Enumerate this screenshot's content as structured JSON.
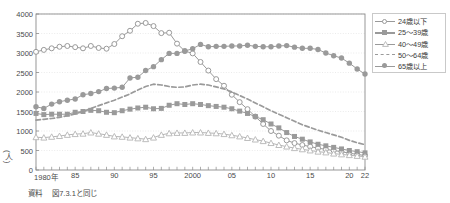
{
  "chart_data": {
    "type": "line",
    "title": "",
    "xlabel": "",
    "ylabel": "(人)",
    "ylim": [
      0,
      4000
    ],
    "ytick_step": 500,
    "yticks": [
      0,
      500,
      1000,
      1500,
      2000,
      2500,
      3000,
      3500,
      4000
    ],
    "grid": true,
    "legend_position": "right",
    "x": [
      1980,
      1981,
      1982,
      1983,
      1984,
      1985,
      1986,
      1987,
      1988,
      1989,
      1990,
      1991,
      1992,
      1993,
      1994,
      1995,
      1996,
      1997,
      1998,
      1999,
      2000,
      2001,
      2002,
      2003,
      2004,
      2005,
      2006,
      2007,
      2008,
      2009,
      2010,
      2011,
      2012,
      2013,
      2014,
      2015,
      2016,
      2017,
      2018,
      2019,
      2020,
      2021,
      2022
    ],
    "xtick_labels": [
      "1980年",
      "85",
      "90",
      "95",
      "2000",
      "05",
      "10",
      "15",
      "20",
      "22"
    ],
    "xtick_values": [
      1980,
      1985,
      1990,
      1995,
      2000,
      2005,
      2010,
      2015,
      2020,
      2022
    ],
    "series": [
      {
        "name": "24歳以下",
        "marker": "open-circle",
        "line": "solid",
        "color": "#9a9a9a",
        "values": [
          3030,
          3080,
          3120,
          3160,
          3180,
          3150,
          3120,
          3180,
          3130,
          3110,
          3230,
          3430,
          3570,
          3750,
          3770,
          3690,
          3510,
          3520,
          3240,
          3050,
          2990,
          2770,
          2550,
          2330,
          2160,
          1930,
          1740,
          1560,
          1370,
          1180,
          1000,
          880,
          760,
          690,
          640,
          600,
          560,
          530,
          500,
          470,
          430,
          400,
          370
        ]
      },
      {
        "name": "25～39歳",
        "marker": "filled-square",
        "line": "solid",
        "color": "#9a9a9a",
        "values": [
          1450,
          1420,
          1430,
          1430,
          1430,
          1480,
          1500,
          1530,
          1520,
          1480,
          1470,
          1520,
          1560,
          1590,
          1610,
          1570,
          1580,
          1660,
          1700,
          1680,
          1700,
          1680,
          1650,
          1630,
          1610,
          1570,
          1510,
          1450,
          1370,
          1290,
          1180,
          1080,
          960,
          860,
          790,
          720,
          660,
          620,
          580,
          540,
          500,
          470,
          440
        ]
      },
      {
        "name": "40～49歳",
        "marker": "open-triangle",
        "line": "solid",
        "color": "#b5b5b5",
        "values": [
          840,
          830,
          850,
          870,
          900,
          920,
          930,
          960,
          930,
          900,
          860,
          850,
          830,
          810,
          790,
          830,
          900,
          940,
          950,
          950,
          960,
          960,
          950,
          940,
          920,
          890,
          860,
          820,
          780,
          740,
          690,
          640,
          600,
          560,
          530,
          500,
          470,
          450,
          420,
          400,
          380,
          360,
          340
        ]
      },
      {
        "name": "50～64歳",
        "marker": "none",
        "line": "dashed",
        "color": "#9a9a9a",
        "values": [
          1280,
          1300,
          1320,
          1350,
          1390,
          1440,
          1500,
          1580,
          1650,
          1720,
          1790,
          1870,
          1950,
          2050,
          2140,
          2200,
          2180,
          2140,
          2120,
          2130,
          2180,
          2200,
          2180,
          2130,
          2080,
          2000,
          1910,
          1820,
          1720,
          1620,
          1520,
          1430,
          1340,
          1250,
          1160,
          1090,
          1020,
          960,
          900,
          840,
          760,
          700,
          650
        ]
      },
      {
        "name": "65歳以上",
        "marker": "filled-circle",
        "line": "solid",
        "color": "#9a9a9a",
        "values": [
          1620,
          1580,
          1690,
          1750,
          1790,
          1820,
          1930,
          1960,
          2010,
          2090,
          2100,
          2120,
          2360,
          2380,
          2550,
          2650,
          2830,
          2990,
          2990,
          3050,
          3110,
          3220,
          3160,
          3170,
          3170,
          3180,
          3180,
          3200,
          3170,
          3160,
          3160,
          3180,
          3190,
          3150,
          3120,
          3120,
          3090,
          3000,
          2930,
          2870,
          2740,
          2590,
          2460
        ]
      }
    ]
  },
  "axis": {
    "y_label": "(人)",
    "y_ticks": [
      "4000",
      "3500",
      "3000",
      "2500",
      "2000",
      "1500",
      "1000",
      "500",
      "0"
    ],
    "x_ticks": [
      "1980年",
      "85",
      "90",
      "95",
      "2000",
      "05",
      "10",
      "15",
      "20",
      "22"
    ]
  },
  "legend": {
    "items": [
      {
        "label": "24歳以下",
        "marker": "open-circle"
      },
      {
        "label": "25～39歳",
        "marker": "filled-square"
      },
      {
        "label": "40～49歳",
        "marker": "open-triangle"
      },
      {
        "label": "50～64歳",
        "marker": "dashed-line"
      },
      {
        "label": "65歳以上",
        "marker": "filled-circle"
      }
    ]
  },
  "footer": {
    "source_label": "資料",
    "source_text": "図7.3.1と同じ"
  },
  "colors": {
    "series_gray": "#9a9a9a",
    "light_gray": "#b5b5b5",
    "axis": "#8c8c8c",
    "grid": "#e2e2e2",
    "text": "#3b3b3b"
  }
}
